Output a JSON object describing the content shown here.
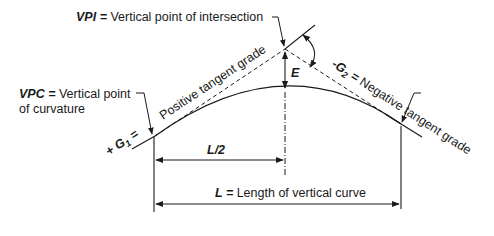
{
  "diagram": {
    "labels": {
      "vpi_abbr": "VPI",
      "vpi_eq": " = ",
      "vpi_desc": "Vertical point of intersection",
      "vpc_abbr": "VPC",
      "vpc_eq": " = ",
      "vpc_desc_line1": "Vertical point",
      "vpc_desc_line2": "of curvature",
      "positive_grade": "Positive tangent grade",
      "g1_label": "+ G",
      "g1_sub": "1",
      "g1_eq": " =",
      "g2_prefix": "-G",
      "g2_sub": "2",
      "g2_eq": " = ",
      "negative_grade": "Negative tangent grade",
      "e_label": "E",
      "half_length": "L/2",
      "length_abbr": "L",
      "length_eq": " = ",
      "length_desc": "Length of vertical curve"
    },
    "colors": {
      "line": "#1a1a1a",
      "background": "#ffffff"
    }
  }
}
